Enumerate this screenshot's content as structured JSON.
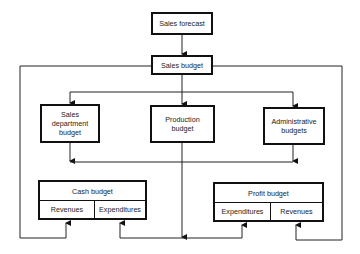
{
  "diagram": {
    "nodes": {
      "sales_forecast": "Sales forecast",
      "sales_budget": "Sales budget",
      "sales_department_budget": "Sales department budget",
      "production_budget": "Production budget",
      "administrative_budgets": "Administrative budgets",
      "cash_budget": {
        "title": "Cash budget",
        "left": "Revenues",
        "right": "Expenditures"
      },
      "profit_budget": {
        "title": "Profit budget",
        "left": "Expenditures",
        "right": "Revenues"
      }
    },
    "edges": [
      {
        "from": "Sales forecast",
        "to": "Sales budget"
      },
      {
        "from": "Sales budget",
        "to": "Sales department budget"
      },
      {
        "from": "Sales budget",
        "to": "Production budget"
      },
      {
        "from": "Sales budget",
        "to": "Administrative budgets"
      },
      {
        "from": "Sales budget",
        "to": "Cash budget.Revenues"
      },
      {
        "from": "Sales budget",
        "to": "Profit budget.Revenues"
      },
      {
        "from": "Sales department budget",
        "to": "Cash budget.Expenditures"
      },
      {
        "from": "Production budget",
        "to": "Cash budget.Expenditures"
      },
      {
        "from": "Administrative budgets",
        "to": "Cash budget.Expenditures"
      },
      {
        "from": "Sales department budget",
        "to": "Profit budget.Expenditures"
      },
      {
        "from": "Production budget",
        "to": "Profit budget.Expenditures"
      },
      {
        "from": "Administrative budgets",
        "to": "Profit budget.Expenditures"
      }
    ]
  }
}
